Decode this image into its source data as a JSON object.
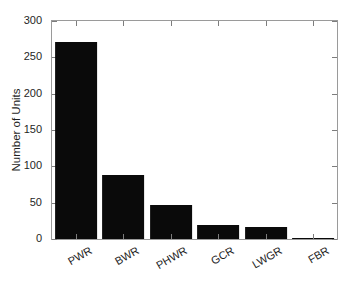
{
  "chart_data": {
    "type": "bar",
    "title": "",
    "xlabel": "",
    "ylabel": "Number of Units",
    "categories": [
      "PWR",
      "BWR",
      "PHWR",
      "GCR",
      "LWGR",
      "FBR"
    ],
    "values": [
      271,
      88,
      47,
      19,
      16,
      1
    ],
    "ylim": [
      0,
      300
    ],
    "yticks": [
      0,
      50,
      100,
      150,
      200,
      250,
      300
    ],
    "ytick_labels": [
      "0",
      "50",
      "100",
      "150",
      "200",
      "250",
      "300"
    ],
    "grid": false,
    "legend": null,
    "bar_color": "#0a0a0a",
    "axis_color": "#9a9a9a",
    "background": "#ffffff",
    "xtick_label_rotation": -30
  }
}
